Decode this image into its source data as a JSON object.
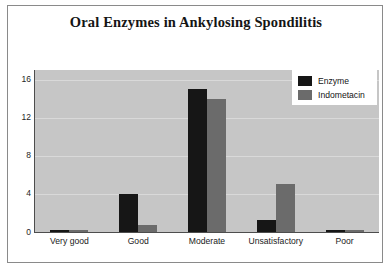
{
  "chart_data": {
    "type": "bar",
    "title": "Oral Enzymes in Ankylosing Spondilitis",
    "xlabel": "",
    "ylabel": "",
    "categories": [
      "Very good",
      "Good",
      "Moderate",
      "Unsatisfactory",
      "Poor"
    ],
    "series": [
      {
        "name": "Enzyme",
        "color": "#161616",
        "values": [
          0,
          4,
          15,
          1.3,
          0
        ]
      },
      {
        "name": "Indometacin",
        "color": "#6b6b6b",
        "values": [
          0,
          0.7,
          14,
          5,
          0
        ]
      }
    ],
    "ylim": [
      0,
      17
    ],
    "yticks": [
      0,
      4,
      8,
      12,
      16
    ],
    "ytick_labels": [
      "0",
      "4",
      "8",
      "12",
      "16"
    ],
    "grid": true,
    "legend_position": "top-right",
    "plot_background": "#c6c6c6",
    "gridline_color": "#d9d9d9",
    "axis_color": "#4d4d4d",
    "figure_background": "#ffffff"
  },
  "legend": {
    "items": [
      {
        "label": "Enzyme"
      },
      {
        "label": "Indometacin"
      }
    ]
  }
}
